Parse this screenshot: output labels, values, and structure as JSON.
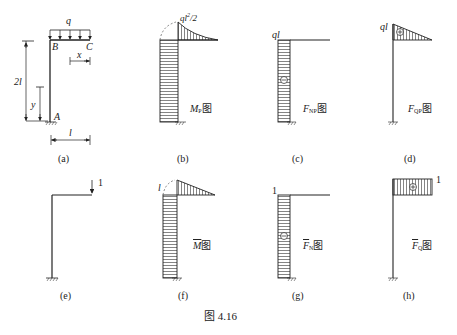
{
  "figure": {
    "caption": "图 4.16",
    "panels": [
      {
        "id": "a",
        "label": "(a)",
        "description": "L-shaped frame: column AB height 2l fixed at A, cantilever BC length l with uniform load q"
      },
      {
        "id": "b",
        "label": "(b)",
        "diagram_label": "MP图",
        "main": "M",
        "sub": "P",
        "suffix": "图",
        "value_label": "ql²/2"
      },
      {
        "id": "c",
        "label": "(c)",
        "diagram_label": "FNP图",
        "main": "F",
        "sub": "NP",
        "suffix": "图",
        "value_label": "ql",
        "sign": "−"
      },
      {
        "id": "d",
        "label": "(d)",
        "diagram_label": "FQP图",
        "main": "F",
        "sub": "QP",
        "suffix": "图",
        "value_label": "ql",
        "sign": "+"
      },
      {
        "id": "e",
        "label": "(e)",
        "description": "Unit load 1 applied downward at free end C",
        "load_label": "1"
      },
      {
        "id": "f",
        "label": "(f)",
        "diagram_label": "M̄图",
        "main": "M",
        "sub": "",
        "suffix": "图",
        "value_label": "l"
      },
      {
        "id": "g",
        "label": "(g)",
        "diagram_label": "F̄N图",
        "main": "F",
        "sub": "N",
        "suffix": "图",
        "value_label": "1",
        "sign": "−"
      },
      {
        "id": "h",
        "label": "(h)",
        "diagram_label": "F̄Q图",
        "main": "F",
        "sub": "Q",
        "suffix": "图",
        "value_label": "1",
        "sign": "+"
      }
    ]
  },
  "panel_a": {
    "load": "q",
    "point_b": "B",
    "point_c": "C",
    "point_a": "A",
    "dim_x": "x",
    "dim_y": "y",
    "dim_height": "2l",
    "dim_span": "l"
  }
}
